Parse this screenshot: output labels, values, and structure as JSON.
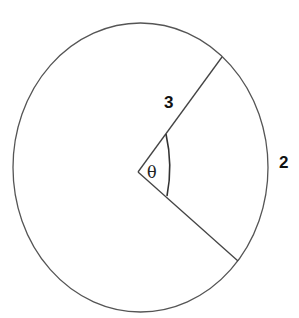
{
  "diagram": {
    "circle": {
      "cx": 140.5,
      "cy": 167.5,
      "rx": 127.5,
      "ry": 144.5,
      "stroke": "#555555"
    },
    "vertex": {
      "x": 138,
      "y": 172
    },
    "radius_upper_end": {
      "x": 222,
      "y": 57
    },
    "radius_lower_end": {
      "x": 238,
      "y": 261
    },
    "labels": {
      "radius": "3",
      "arc": "2",
      "angle": "θ"
    }
  }
}
